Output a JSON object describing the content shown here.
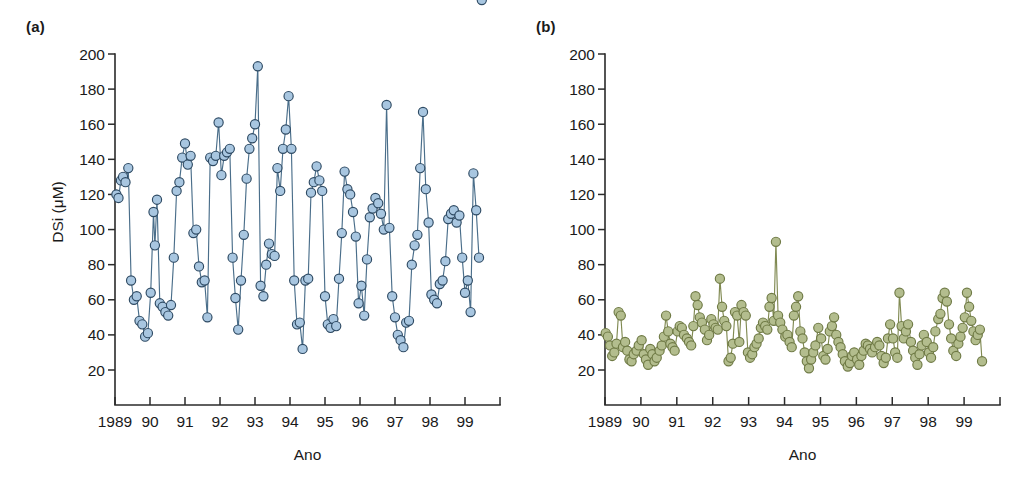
{
  "figure": {
    "background": "#ffffff",
    "panels": [
      {
        "tag": "(a)",
        "ylabel": "DSi (μM)",
        "xlabel": "Ano",
        "marker_fill": "#a8c6e0",
        "marker_stroke": "#2e4a63",
        "line_color": "#4a6e8a"
      },
      {
        "tag": "(b)",
        "ylabel": "",
        "xlabel": "Ano",
        "marker_fill": "#b3bd8e",
        "marker_stroke": "#6f7a45",
        "line_color": "#808a52"
      }
    ]
  },
  "chart_data": [
    {
      "type": "line",
      "title": "(a)",
      "xlabel": "Ano",
      "ylabel": "DSi (μM)",
      "xlim": [
        1989.0,
        2000.0
      ],
      "ylim": [
        0,
        200
      ],
      "yticks": [
        20,
        40,
        60,
        80,
        100,
        120,
        140,
        160,
        180,
        200
      ],
      "ytick_labels": [
        "20",
        "40",
        "60",
        "80",
        "100",
        "120",
        "140",
        "160",
        "180",
        "200"
      ],
      "xticks": [
        1989,
        1990,
        1991,
        1992,
        1993,
        1994,
        1995,
        1996,
        1997,
        1998,
        1999
      ],
      "xtick_labels": [
        "1989",
        "90",
        "91",
        "92",
        "93",
        "94",
        "95",
        "96",
        "97",
        "98",
        "99"
      ],
      "grid": false,
      "legend": "none",
      "marker": "circle",
      "series": [
        {
          "name": "DSi",
          "color": "#a8c6e0",
          "x": [
            1989.04,
            1989.1,
            1989.17,
            1989.23,
            1989.3,
            1989.38,
            1989.46,
            1989.54,
            1989.62,
            1989.7,
            1989.78,
            1989.86,
            1989.94,
            1990.02,
            1990.1,
            1990.14,
            1990.2,
            1990.28,
            1990.36,
            1990.44,
            1990.52,
            1990.6,
            1990.68,
            1990.76,
            1990.84,
            1990.92,
            1991.0,
            1991.08,
            1991.16,
            1991.24,
            1991.32,
            1991.4,
            1991.48,
            1991.56,
            1991.64,
            1991.72,
            1991.8,
            1991.88,
            1991.96,
            1992.04,
            1992.12,
            1992.2,
            1992.28,
            1992.36,
            1992.44,
            1992.52,
            1992.6,
            1992.68,
            1992.76,
            1992.84,
            1992.92,
            1993.0,
            1993.08,
            1993.16,
            1993.24,
            1993.32,
            1993.4,
            1993.48,
            1993.56,
            1993.64,
            1993.72,
            1993.8,
            1993.88,
            1993.96,
            1994.04,
            1994.12,
            1994.2,
            1994.28,
            1994.36,
            1994.44,
            1994.52,
            1994.6,
            1994.68,
            1994.76,
            1994.84,
            1994.92,
            1995.0,
            1995.08,
            1995.16,
            1995.24,
            1995.32,
            1995.4,
            1995.48,
            1995.56,
            1995.64,
            1995.72,
            1995.8,
            1995.88,
            1995.96,
            1996.04,
            1996.12,
            1996.2,
            1996.28,
            1996.36,
            1996.44,
            1996.52,
            1996.6,
            1996.68,
            1996.76,
            1996.84,
            1996.92,
            1997.0,
            1997.08,
            1997.16,
            1997.24,
            1997.32,
            1997.4,
            1997.48,
            1997.56,
            1997.64,
            1997.72,
            1997.8,
            1997.88,
            1997.96,
            1998.04,
            1998.12,
            1998.2,
            1998.28,
            1998.36,
            1998.44,
            1998.52,
            1998.6,
            1998.68,
            1998.76,
            1998.84,
            1998.92,
            1999.0,
            1999.08,
            1999.16,
            1999.24,
            1999.32,
            1999.4,
            1999.48
          ],
          "y": [
            120,
            118,
            128,
            130,
            127,
            135,
            71,
            60,
            62,
            48,
            46,
            39,
            41,
            64,
            110,
            91,
            117,
            58,
            56,
            53,
            51,
            57,
            84,
            122,
            127,
            141,
            149,
            137,
            142,
            98,
            100,
            79,
            70,
            71,
            50,
            141,
            139,
            142,
            161,
            131,
            142,
            144,
            146,
            84,
            61,
            43,
            71,
            97,
            129,
            146,
            152,
            160,
            193,
            68,
            62,
            80,
            92,
            86,
            85,
            135,
            122,
            146,
            157,
            176,
            146,
            71,
            46,
            47,
            32,
            71,
            72,
            121,
            127,
            136,
            128,
            122,
            62,
            46,
            44,
            49,
            45,
            72,
            98,
            133,
            123,
            120,
            110,
            96,
            58,
            68,
            51,
            83,
            107,
            112,
            118,
            115,
            109,
            100,
            171,
            101,
            62,
            50,
            40,
            37,
            33,
            47,
            48,
            80,
            91,
            97,
            135,
            167,
            123,
            104,
            63,
            60,
            58,
            69,
            71,
            82,
            106,
            109,
            111,
            104,
            108,
            84,
            64,
            71,
            53,
            132,
            111,
            84
          ]
        }
      ]
    },
    {
      "type": "line",
      "title": "(b)",
      "xlabel": "Ano",
      "ylabel": "",
      "xlim": [
        1989.0,
        2000.0
      ],
      "ylim": [
        0,
        200
      ],
      "yticks": [
        20,
        40,
        60,
        80,
        100,
        120,
        140,
        160,
        180,
        200
      ],
      "ytick_labels": [
        "20",
        "40",
        "60",
        "80",
        "100",
        "120",
        "140",
        "160",
        "180",
        "200"
      ],
      "xticks": [
        1989,
        1990,
        1991,
        1992,
        1993,
        1994,
        1995,
        1996,
        1997,
        1998,
        1999
      ],
      "xtick_labels": [
        "1989",
        "90",
        "91",
        "92",
        "93",
        "94",
        "95",
        "96",
        "97",
        "98",
        "99"
      ],
      "grid": false,
      "legend": "none",
      "marker": "circle",
      "series": [
        {
          "name": "DSi",
          "color": "#b3bd8e",
          "x": [
            1989.02,
            1989.08,
            1989.14,
            1989.2,
            1989.26,
            1989.32,
            1989.38,
            1989.44,
            1989.5,
            1989.56,
            1989.62,
            1989.68,
            1989.74,
            1989.8,
            1989.88,
            1989.94,
            1990.02,
            1990.08,
            1990.14,
            1990.2,
            1990.26,
            1990.32,
            1990.38,
            1990.44,
            1990.52,
            1990.58,
            1990.64,
            1990.7,
            1990.76,
            1990.82,
            1990.88,
            1990.94,
            1991.02,
            1991.08,
            1991.14,
            1991.2,
            1991.28,
            1991.34,
            1991.4,
            1991.46,
            1991.52,
            1991.58,
            1991.64,
            1991.7,
            1991.78,
            1991.84,
            1991.9,
            1991.96,
            1992.02,
            1992.08,
            1992.14,
            1992.2,
            1992.26,
            1992.32,
            1992.38,
            1992.44,
            1992.5,
            1992.56,
            1992.62,
            1992.68,
            1992.74,
            1992.8,
            1992.86,
            1992.92,
            1992.98,
            1993.04,
            1993.1,
            1993.16,
            1993.22,
            1993.28,
            1993.34,
            1993.4,
            1993.46,
            1993.52,
            1993.58,
            1993.64,
            1993.7,
            1993.76,
            1993.82,
            1993.88,
            1993.94,
            1994.02,
            1994.08,
            1994.14,
            1994.2,
            1994.26,
            1994.32,
            1994.38,
            1994.44,
            1994.5,
            1994.56,
            1994.62,
            1994.68,
            1994.74,
            1994.8,
            1994.86,
            1994.94,
            1995.02,
            1995.08,
            1995.14,
            1995.2,
            1995.26,
            1995.32,
            1995.38,
            1995.44,
            1995.5,
            1995.56,
            1995.62,
            1995.68,
            1995.76,
            1995.82,
            1995.88,
            1995.94,
            1996.02,
            1996.08,
            1996.14,
            1996.2,
            1996.26,
            1996.32,
            1996.38,
            1996.44,
            1996.52,
            1996.58,
            1996.64,
            1996.7,
            1996.76,
            1996.82,
            1996.88,
            1996.94,
            1997.02,
            1997.08,
            1997.14,
            1997.2,
            1997.26,
            1997.32,
            1997.38,
            1997.44,
            1997.52,
            1997.58,
            1997.64,
            1997.7,
            1997.76,
            1997.82,
            1997.88,
            1997.96,
            1998.02,
            1998.08,
            1998.14,
            1998.2,
            1998.28,
            1998.34,
            1998.4,
            1998.46,
            1998.52,
            1998.58,
            1998.64,
            1998.7,
            1998.78,
            1998.84,
            1998.9,
            1998.96,
            1999.02,
            1999.08,
            1999.14,
            1999.2,
            1999.26,
            1999.32,
            1999.38,
            1999.44,
            1999.5
          ],
          "y": [
            41,
            39,
            34,
            28,
            30,
            35,
            53,
            51,
            33,
            36,
            31,
            26,
            25,
            29,
            31,
            34,
            37,
            29,
            26,
            23,
            32,
            29,
            25,
            27,
            31,
            34,
            39,
            51,
            42,
            35,
            33,
            31,
            42,
            45,
            44,
            40,
            38,
            36,
            34,
            45,
            62,
            57,
            50,
            47,
            43,
            37,
            40,
            49,
            46,
            44,
            43,
            72,
            56,
            48,
            45,
            25,
            27,
            35,
            53,
            51,
            36,
            57,
            53,
            51,
            30,
            27,
            29,
            33,
            35,
            38,
            44,
            47,
            45,
            43,
            56,
            61,
            48,
            93,
            51,
            47,
            43,
            39,
            40,
            36,
            33,
            51,
            56,
            62,
            42,
            38,
            30,
            25,
            21,
            26,
            30,
            34,
            44,
            38,
            28,
            26,
            32,
            42,
            45,
            50,
            40,
            36,
            33,
            29,
            25,
            22,
            24,
            28,
            30,
            26,
            23,
            28,
            31,
            35,
            34,
            32,
            30,
            33,
            36,
            34,
            28,
            24,
            27,
            38,
            46,
            38,
            30,
            27,
            64,
            45,
            38,
            42,
            46,
            36,
            31,
            27,
            23,
            29,
            34,
            40,
            36,
            30,
            27,
            33,
            42,
            49,
            52,
            61,
            64,
            59,
            46,
            38,
            31,
            28,
            35,
            39,
            44,
            50,
            64,
            56,
            48,
            42,
            37,
            40,
            43,
            25
          ]
        }
      ]
    }
  ]
}
